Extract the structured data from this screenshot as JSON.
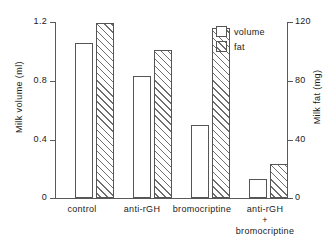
{
  "chart_data": {
    "type": "bar",
    "title": "",
    "subtitle": "",
    "categories": [
      "control",
      "anti-rGH",
      "bromocriptine",
      "anti-rGH\n+\nbromocriptine"
    ],
    "series": [
      {
        "name": "volume",
        "axis": "left",
        "values": [
          1.06,
          0.83,
          0.5,
          0.13
        ],
        "fill": "white",
        "edge": "#555555"
      },
      {
        "name": "fat",
        "axis": "right",
        "values": [
          119,
          101,
          116,
          23
        ],
        "fill": "hatched",
        "edge": "#555555"
      }
    ],
    "xlabel": "",
    "ylabel": "Milk volume (ml)",
    "y2label": "Milk fat (mg)",
    "ylim": [
      0,
      1.2
    ],
    "y2lim": [
      0,
      120
    ],
    "yticks": [
      "0",
      "0.4",
      "0.8",
      "1.2"
    ],
    "ytick_values": [
      0,
      0.4,
      0.8,
      1.2
    ],
    "y2ticks": [
      "0",
      "40",
      "80",
      "120"
    ],
    "y2tick_values": [
      0,
      40,
      80,
      120
    ],
    "grid": false,
    "legend": {
      "position": "top-right",
      "entries": [
        "volume",
        "fat"
      ]
    }
  },
  "legend": {
    "volume_label": "volume",
    "fat_label": "fat"
  },
  "axes": {
    "left_title": "Milk volume (ml)",
    "right_title": "Milk fat (mg)",
    "left_ticks": [
      "1.2",
      "0.8",
      "0.4",
      "0"
    ],
    "right_ticks": [
      "120",
      "80",
      "40",
      "0"
    ]
  },
  "categories": {
    "c0": "control",
    "c1": "anti-rGH",
    "c2": "bromocriptine",
    "c3": "anti-rGH\n+\nbromocriptine"
  }
}
